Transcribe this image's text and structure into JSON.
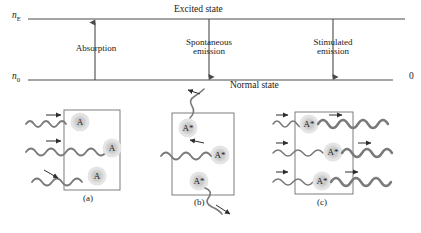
{
  "figure": {
    "caption_panels": [
      "(a)",
      "(b)",
      "(c)"
    ]
  },
  "energy_diagram": {
    "upper_level_label": "n",
    "upper_level_sub": "E",
    "lower_level_label": "n",
    "lower_level_sub": "0",
    "upper_state_text": "Excited state",
    "lower_state_text": "Normal state",
    "right_axis_zero": "0",
    "transitions": [
      {
        "name": "Absorption",
        "line1": "Absorption",
        "line2": "",
        "direction": "up"
      },
      {
        "name": "Spontaneous emission",
        "line1": "Spontaneous",
        "line2": "emission",
        "direction": "down"
      },
      {
        "name": "Stimulated emission",
        "line1": "Stimulated",
        "line2": "emission",
        "direction": "down"
      }
    ]
  },
  "panels": [
    {
      "id": "a",
      "caption": "(a)",
      "process": "absorption",
      "atom_label": "A",
      "atoms": [
        "A",
        "A",
        "A"
      ]
    },
    {
      "id": "b",
      "caption": "(b)",
      "process": "spontaneous-emission",
      "atom_label": "A*",
      "atoms": [
        "A*",
        "A*",
        "A*"
      ]
    },
    {
      "id": "c",
      "caption": "(c)",
      "process": "stimulated-emission",
      "atom_label": "A*",
      "atoms": [
        "A*",
        "A*",
        "A*"
      ]
    }
  ],
  "colors": {
    "line": "#4a4a4a",
    "wave": "#7a7a7a",
    "atom_fill": "#cfcfcf",
    "atom_halo": "#e2e2e2",
    "box": "#6f6f6f",
    "text": "#1a1a1a"
  }
}
